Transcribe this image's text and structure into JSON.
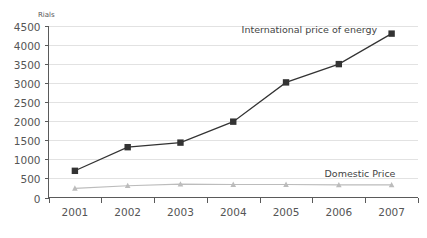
{
  "chart_data": {
    "type": "line",
    "title": "",
    "xlabel": "",
    "ylabel": "Rials",
    "categories": [
      "2001",
      "2002",
      "2003",
      "2004",
      "2005",
      "2006",
      "2007"
    ],
    "ylim": [
      0,
      4500
    ],
    "y_ticks": [
      0,
      500,
      1000,
      1500,
      2000,
      2500,
      3000,
      3500,
      4000,
      4500
    ],
    "y_tick_labels": [
      "0",
      "500",
      "1000",
      "1500",
      "2000",
      "2500",
      "3000",
      "3500",
      "4000",
      "4500"
    ],
    "grid": true,
    "legend_position": "inline-annotation",
    "series": [
      {
        "name": "International price of energy",
        "values": [
          700,
          1320,
          1440,
          1990,
          3020,
          3500,
          4300
        ],
        "color": "#333333",
        "marker": "square",
        "annotation": "International price of energy"
      },
      {
        "name": "Domestic Price",
        "values": [
          240,
          310,
          350,
          340,
          340,
          330,
          330
        ],
        "color": "#bcbcbc",
        "marker": "triangle",
        "annotation": "Domestic Price"
      }
    ]
  },
  "axis": {
    "unit_label": "Rials"
  },
  "annotations": {
    "international": "International price of energy",
    "domestic": "Domestic Price"
  },
  "colors": {
    "international_line": "#333333",
    "domestic_line": "#bcbcbc",
    "gridline": "#e2e2e2",
    "axis": "#5a5a5a",
    "text": "#555555",
    "background": "#ffffff"
  }
}
